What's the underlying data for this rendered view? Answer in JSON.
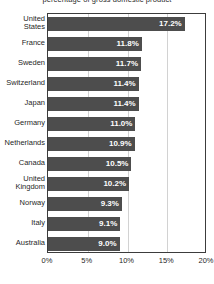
{
  "chart_data": {
    "type": "bar",
    "orientation": "horizontal",
    "title": "percentage of gross domestic product",
    "xlabel": "",
    "ylabel": "",
    "xlim": [
      0,
      20
    ],
    "xtick_labels": [
      "0%",
      "5%",
      "10%",
      "15%",
      "20%"
    ],
    "xticks": [
      0,
      5,
      10,
      15,
      20
    ],
    "grid": true,
    "legend": false,
    "value_suffix": "%",
    "bar_color": "#4d4d4d",
    "value_label_color": "#ffffff",
    "plot_border_color": "#3c3c3c",
    "gridline_color": "#d2d2d2",
    "categories": [
      "United States",
      "France",
      "Sweden",
      "Switzerland",
      "Japan",
      "Germany",
      "Netherlands",
      "Canada",
      "United Kingdom",
      "Norway",
      "Italy",
      "Australia"
    ],
    "values": [
      17.2,
      11.8,
      11.7,
      11.4,
      11.4,
      11.0,
      10.9,
      10.5,
      10.2,
      9.3,
      9.1,
      9.0
    ],
    "value_labels": [
      "17.2%",
      "11.8%",
      "11.7%",
      "11.4%",
      "11.4%",
      "11.0%",
      "10.9%",
      "10.5%",
      "10.2%",
      "9.3%",
      "9.1%",
      "9.0%"
    ],
    "category_label_lines": [
      [
        "United",
        "States"
      ],
      [
        "France"
      ],
      [
        "Sweden"
      ],
      [
        "Switzerland"
      ],
      [
        "Japan"
      ],
      [
        "Germany"
      ],
      [
        "Netherlands"
      ],
      [
        "Canada"
      ],
      [
        "United",
        "Kingdom"
      ],
      [
        "Norway"
      ],
      [
        "Italy"
      ],
      [
        "Australia"
      ]
    ]
  }
}
